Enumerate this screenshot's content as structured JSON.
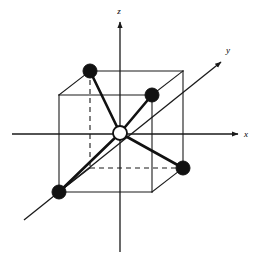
{
  "figure": {
    "type": "crystal-structure-diagram",
    "background_color": "#ffffff",
    "line_color": "#1a1a1a",
    "atom_fill_color": "#111111",
    "center_atom_fill_color": "#ffffff"
  },
  "axes": {
    "x": {
      "label": "x",
      "label_x": 246,
      "label_y": 137,
      "line": {
        "x1": 12,
        "y1": 134,
        "x2": 238,
        "y2": 134
      },
      "arrow_tip": {
        "x": 240,
        "y": 134
      },
      "direction": "right"
    },
    "y": {
      "label": "y",
      "label_x": 228,
      "label_y": 53,
      "line": {
        "x1": 24,
        "y1": 220,
        "x2": 221,
        "y2": 62
      },
      "arrow_tip": {
        "x": 223,
        "y": 60
      },
      "direction": "upper-right-diagonal"
    },
    "z": {
      "label": "z",
      "label_x": 119,
      "label_y": 14,
      "line": {
        "x1": 120,
        "y1": 252,
        "x2": 120,
        "y2": 22
      },
      "arrow_tip": {
        "x": 120,
        "y": 20
      },
      "direction": "up"
    }
  },
  "cube": {
    "front_face": {
      "name": "front-face",
      "points": "59,95 152,95 152,192 59,192"
    },
    "back_face": {
      "name": "back-face",
      "points": "90,71 183,71 183,168 90,168"
    },
    "solid_edges": [
      {
        "name": "front-top-edge",
        "x1": 59,
        "y1": 95,
        "x2": 152,
        "y2": 95
      },
      {
        "name": "front-left-edge",
        "x1": 59,
        "y1": 95,
        "x2": 59,
        "y2": 192
      },
      {
        "name": "front-right-edge",
        "x1": 152,
        "y1": 95,
        "x2": 152,
        "y2": 192
      },
      {
        "name": "front-bottom-edge",
        "x1": 59,
        "y1": 192,
        "x2": 152,
        "y2": 192
      },
      {
        "name": "back-top-edge",
        "x1": 90,
        "y1": 71,
        "x2": 183,
        "y2": 71
      },
      {
        "name": "back-right-edge",
        "x1": 183,
        "y1": 71,
        "x2": 183,
        "y2": 168
      },
      {
        "name": "back-bottom-right-edge",
        "x1": 152,
        "y1": 192,
        "x2": 183,
        "y2": 168
      },
      {
        "name": "top-left-connector",
        "x1": 59,
        "y1": 95,
        "x2": 90,
        "y2": 71
      },
      {
        "name": "top-right-connector",
        "x1": 152,
        "y1": 95,
        "x2": 183,
        "y2": 71
      },
      {
        "name": "bottom-left-connector",
        "x1": 59,
        "y1": 192,
        "x2": 90,
        "y2": 168
      }
    ],
    "hidden_edges": [
      {
        "name": "back-left-vertical-hidden-edge",
        "x1": 90,
        "y1": 71,
        "x2": 90,
        "y2": 168
      },
      {
        "name": "back-bottom-hidden-edge",
        "x1": 90,
        "y1": 168,
        "x2": 183,
        "y2": 168
      }
    ]
  },
  "atoms": {
    "center": {
      "name": "central-atom",
      "style": "open-circle",
      "cx": 120,
      "cy": 133,
      "r": 7
    },
    "corners": [
      {
        "name": "atom-back-top-left",
        "style": "filled-circle",
        "cx": 90,
        "cy": 71,
        "r": 7
      },
      {
        "name": "atom-front-top-right",
        "style": "filled-circle",
        "cx": 152,
        "cy": 95,
        "r": 7
      },
      {
        "name": "atom-front-bottom-left",
        "style": "filled-circle",
        "cx": 59,
        "cy": 192,
        "r": 7
      },
      {
        "name": "atom-back-bottom-right",
        "style": "filled-circle",
        "cx": 183,
        "cy": 168,
        "r": 7
      }
    ]
  },
  "bonds": [
    {
      "name": "bond-to-back-top-left",
      "x1": 120,
      "y1": 133,
      "x2": 90,
      "y2": 71
    },
    {
      "name": "bond-to-front-top-right",
      "x1": 120,
      "y1": 133,
      "x2": 152,
      "y2": 95
    },
    {
      "name": "bond-to-front-bottom-left",
      "x1": 120,
      "y1": 133,
      "x2": 59,
      "y2": 192
    },
    {
      "name": "bond-to-back-bottom-right",
      "x1": 120,
      "y1": 133,
      "x2": 183,
      "y2": 168
    }
  ]
}
